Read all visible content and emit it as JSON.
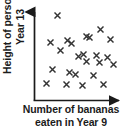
{
  "figure": {
    "type": "scatter-graph",
    "marker_symbol": "x",
    "marker_color": "#333333",
    "axis_color": "#1a1a1a",
    "background": "#ffffff"
  },
  "axes": {
    "y_label_line1": "Height of person in",
    "y_label_line2": "Year 13",
    "x_label_line1": "Number of bananas",
    "x_label_line2": "eaten in Year 9"
  },
  "chart_data": {
    "type": "scatter",
    "title": "",
    "xlabel": "Number of bananas eaten in Year 9",
    "ylabel": "Height of person in Year 13",
    "grid": false,
    "legend": null,
    "xticks": [],
    "yticks": [],
    "xlim": [
      0,
      100
    ],
    "ylim": [
      0,
      100
    ],
    "series": [
      {
        "name": "students",
        "n_points": 24,
        "points": [
          [
            22,
            92
          ],
          [
            77,
            76
          ],
          [
            13,
            62
          ],
          [
            35,
            64
          ],
          [
            60,
            68
          ],
          [
            63,
            67
          ],
          [
            90,
            65
          ],
          [
            41,
            60
          ],
          [
            26,
            52
          ],
          [
            56,
            48
          ],
          [
            49,
            45
          ],
          [
            73,
            46
          ],
          [
            87,
            44
          ],
          [
            60,
            40
          ],
          [
            76,
            38
          ],
          [
            94,
            36
          ],
          [
            16,
            30
          ],
          [
            38,
            27
          ],
          [
            45,
            25
          ],
          [
            68,
            24
          ],
          [
            8,
            14
          ],
          [
            34,
            13
          ],
          [
            55,
            12
          ],
          [
            81,
            13
          ]
        ]
      }
    ]
  }
}
